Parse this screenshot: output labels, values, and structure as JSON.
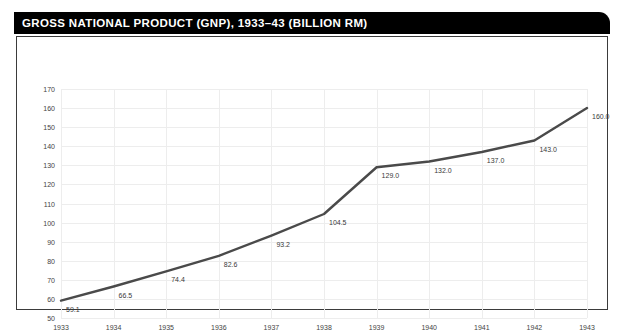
{
  "title": "GROSS NATIONAL PRODUCT (GNP), 1933–43 (BILLION RM)",
  "colors": {
    "banner_background": "#000000",
    "banner_text": "#ffffff",
    "frame_border": "#3b3b3b",
    "plot_background": "#ffffff",
    "gridline": "#ededed",
    "series_line": "#4a4a4a",
    "tick_text": "#444444",
    "label_text": "#3a3a3a"
  },
  "chart_data": {
    "type": "line",
    "title": "GROSS NATIONAL PRODUCT (GNP), 1933–43 (BILLION RM)",
    "xlabel": "",
    "ylabel": "",
    "categories": [
      "1933",
      "1934",
      "1935",
      "1936",
      "1937",
      "1938",
      "1939",
      "1940",
      "1941",
      "1942",
      "1943"
    ],
    "values": [
      59.1,
      66.5,
      74.4,
      82.6,
      93.2,
      104.5,
      129.0,
      132.0,
      137.0,
      143.0,
      160.0
    ],
    "point_labels": [
      "59.1",
      "66.5",
      "74.4",
      "82.6",
      "93.2",
      "104.5",
      "129.0",
      "132.0",
      "137.0",
      "143.0",
      "160.0"
    ],
    "ylim": [
      50,
      170
    ],
    "ytick_values": [
      50,
      60,
      70,
      80,
      90,
      100,
      110,
      120,
      130,
      140,
      150,
      160,
      170
    ],
    "ytick_labels": [
      "50",
      "60",
      "70",
      "80",
      "90",
      "100",
      "110",
      "120",
      "130",
      "140",
      "150",
      "160",
      "170"
    ],
    "xtick_labels": [
      "1933",
      "1934",
      "1935",
      "1936",
      "1937",
      "1938",
      "1939",
      "1940",
      "1941",
      "1942",
      "1943"
    ],
    "grid": true,
    "legend": false,
    "markers": false,
    "units": "billion RM"
  }
}
